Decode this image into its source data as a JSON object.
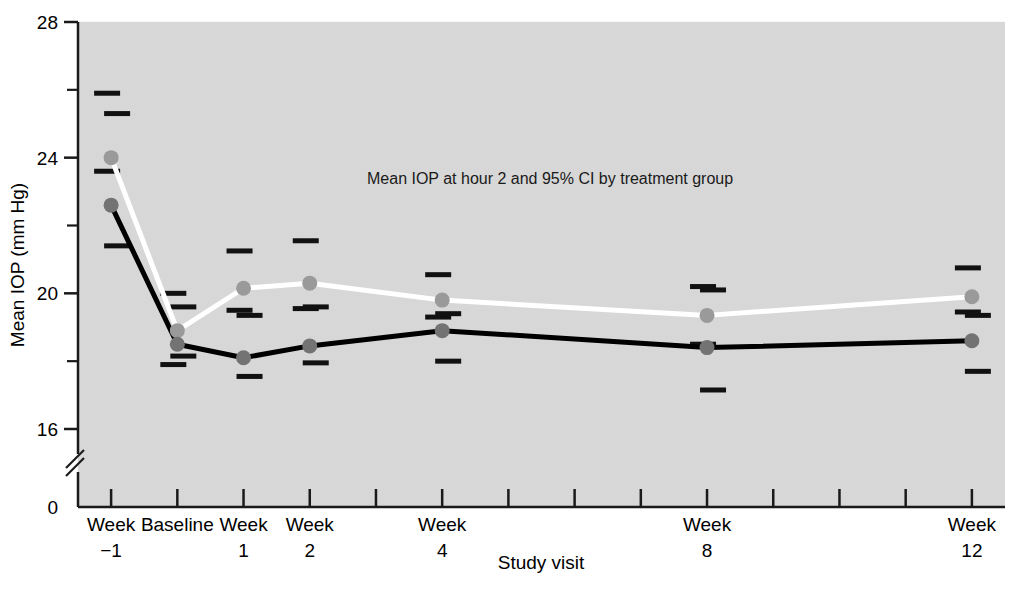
{
  "chart_data": {
    "type": "line",
    "title": "",
    "annotation": "Mean IOP at hour 2 and 95% CI by treatment group",
    "xlabel": "Study visit",
    "ylabel": "Mean IOP (mm Hg)",
    "categories": [
      "Week\n−1",
      "Baseline",
      "Week\n1",
      "Week\n2",
      "Week\n4",
      "Week\n8",
      "Week\n12"
    ],
    "x_tick_labels": [
      {
        "line1": "Week",
        "line2": "−1"
      },
      {
        "line1": "Baseline",
        "line2": ""
      },
      {
        "line1": "Week",
        "line2": "1"
      },
      {
        "line1": "Week",
        "line2": "2"
      },
      {
        "line1": "Week",
        "line2": "4"
      },
      {
        "line1": "Week",
        "line2": "8"
      },
      {
        "line1": "Week",
        "line2": "12"
      }
    ],
    "x_positions": [
      0,
      1,
      2,
      3,
      5,
      9,
      13
    ],
    "x_axis_total_ticks": 14,
    "y_tick_labels": [
      "0",
      "16",
      "20",
      "24",
      "28"
    ],
    "y_major_ticks": [
      16,
      20,
      24,
      28
    ],
    "y_minor_ticks": [
      18,
      22,
      26
    ],
    "ylim": [
      15.0,
      28.0
    ],
    "y_axis_break": true,
    "y_axis_break_label": "0",
    "grid": false,
    "legend_position": "none",
    "series": [
      {
        "name": "light-gray-series",
        "color": "#999999",
        "line_color": "#ffffff",
        "marker_color": "#9a9a9a",
        "values": [
          24.0,
          18.9,
          20.15,
          20.3,
          19.8,
          19.35,
          19.9
        ],
        "ci_upper": [
          25.9,
          20.0,
          21.25,
          21.55,
          20.55,
          20.2,
          20.75
        ],
        "ci_lower": [
          23.6,
          17.9,
          19.5,
          19.55,
          19.3,
          18.5,
          19.45
        ]
      },
      {
        "name": "dark-series",
        "color": "#000000",
        "line_color": "#000000",
        "marker_color": "#737373",
        "values": [
          22.6,
          18.5,
          18.1,
          18.45,
          18.9,
          18.4,
          18.6
        ],
        "ci_upper": [
          25.3,
          19.6,
          19.35,
          19.6,
          19.4,
          20.1,
          19.35
        ],
        "ci_lower": [
          21.4,
          18.15,
          17.55,
          17.95,
          18.0,
          17.15,
          17.7
        ]
      }
    ]
  },
  "figure": {
    "plot_bg_color": "#d9d9d9",
    "page_bg_color": "#ffffff",
    "axis_color": "#1a1a1a"
  }
}
